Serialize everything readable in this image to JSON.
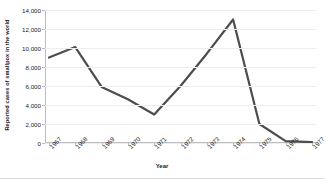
{
  "chart_data": {
    "type": "line",
    "title": "",
    "xlabel": "Year",
    "ylabel": "Reported cases of smallpox in the world",
    "categories": [
      "1967",
      "1968",
      "1969",
      "1970",
      "1971",
      "1972",
      "1973",
      "1974",
      "1975",
      "1976",
      "1977"
    ],
    "values": [
      9000,
      10100,
      5900,
      4600,
      3000,
      6000,
      9400,
      13000,
      2000,
      200,
      100
    ],
    "ylim": [
      0,
      14000
    ],
    "ytick_labels": [
      "0",
      "2,000",
      "4,000",
      "6,000",
      "8,000",
      "10,000",
      "12,000",
      "14,000"
    ],
    "ytick_values": [
      0,
      2000,
      4000,
      6000,
      8000,
      10000,
      12000,
      14000
    ],
    "grid": true,
    "legend": false,
    "series_color": "#4d4d4d",
    "grid_color": "#ededed",
    "axis_color": "#bdbdbd",
    "background": "#ffffff"
  }
}
